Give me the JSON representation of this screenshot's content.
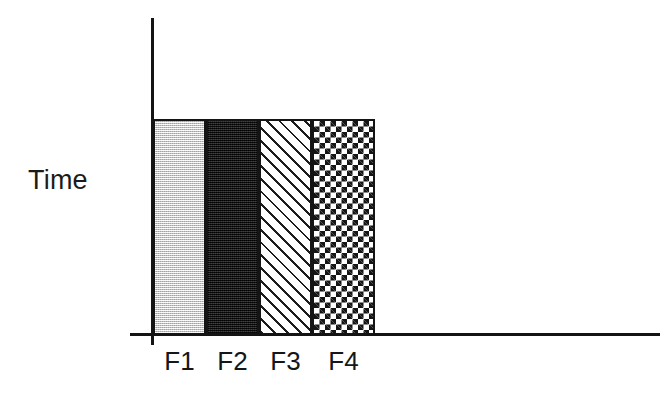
{
  "chart_data": {
    "type": "bar",
    "title": "",
    "subtitle": "",
    "xlabel": "",
    "ylabel": "Time",
    "categories": [
      "F1",
      "F2",
      "F3",
      "F4"
    ],
    "values": [
      1,
      1,
      1,
      1
    ],
    "ylim": [
      0,
      1.35
    ],
    "grid": false,
    "legend": null,
    "annotations": [],
    "series": [
      {
        "name": "Time",
        "values": [
          1,
          1,
          1,
          1
        ]
      }
    ],
    "bars": [
      {
        "category": "F1",
        "value": 1,
        "fill": "light-gray-dither",
        "fill_color": "#d2d2d2",
        "outline_color": "#141414"
      },
      {
        "category": "F2",
        "value": 1,
        "fill": "solid-dark",
        "fill_color": "#2b2b2b",
        "outline_color": "#141414"
      },
      {
        "category": "F3",
        "value": 1,
        "fill": "diagonal-hatch",
        "fill_color": "#ffffff",
        "outline_color": "#141414"
      },
      {
        "category": "F4",
        "value": 1,
        "fill": "checkerboard",
        "fill_color": "#ffffff",
        "outline_color": "#141414"
      }
    ]
  },
  "axes": {
    "y_label": "Time",
    "x_tick_labels": [
      "F1",
      "F2",
      "F3",
      "F4"
    ],
    "axis_color": "#141414"
  },
  "colors": {
    "background": "#ffffff",
    "ink": "#141414",
    "bar_f1": "#d2d2d2",
    "bar_f2": "#2b2b2b",
    "bar_f3": "#ffffff",
    "bar_f4": "#ffffff"
  }
}
